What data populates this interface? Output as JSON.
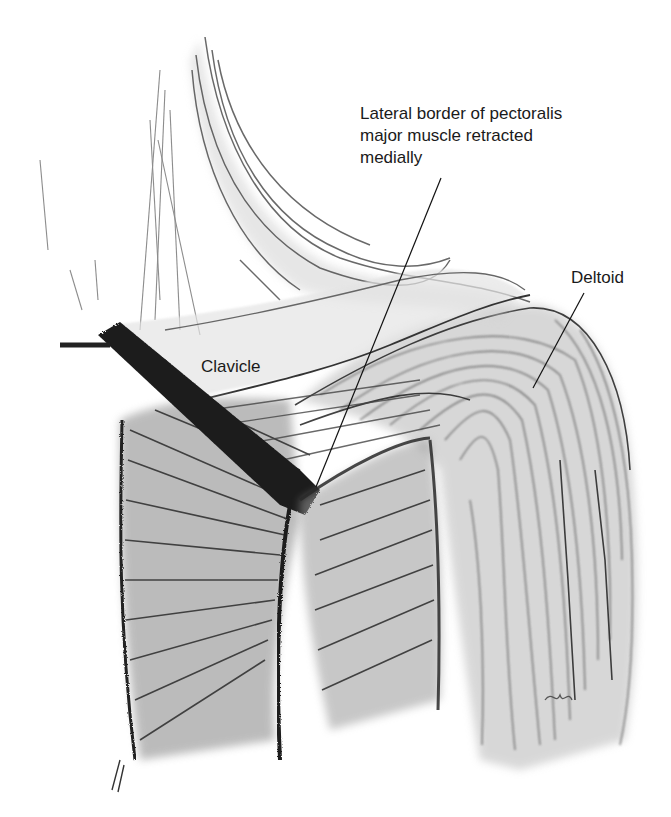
{
  "figure": {
    "type": "anatomical-illustration",
    "colors": {
      "background": "#ffffff",
      "ink": "#1a1a1a",
      "shade_dark": "#3a3a3a",
      "shade_mid": "#8a8a8a",
      "shade_light": "#c8c8c8"
    }
  },
  "labels": {
    "pectoralis": {
      "text": "Lateral border of pectoralis\nmajor muscle retracted\nmedially",
      "x": 360,
      "y": 103,
      "leader": [
        [
          441,
          178
        ],
        [
          316,
          487
        ]
      ]
    },
    "clavicle": {
      "text": "Clavicle",
      "x": 201,
      "y": 356
    },
    "deltoid": {
      "text": "Deltoid",
      "x": 571,
      "y": 267,
      "leader": [
        [
          584,
          293
        ],
        [
          533,
          388
        ]
      ]
    }
  }
}
